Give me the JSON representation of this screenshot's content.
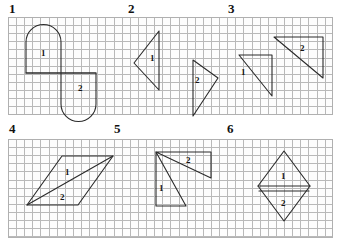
{
  "page": {
    "background_color": "#ffffff",
    "grid_color": "#b9b9b9",
    "ink_color": "#2a2a2a"
  },
  "rows": [
    {
      "band_name": "top-grid-band",
      "panels": [
        {
          "number": "1",
          "parts": [
            "1",
            "2"
          ]
        },
        {
          "number": "2",
          "parts": [
            "1",
            "2"
          ]
        },
        {
          "number": "3",
          "parts": [
            "1",
            "2"
          ]
        }
      ]
    },
    {
      "band_name": "bottom-grid-band",
      "panels": [
        {
          "number": "4",
          "parts": [
            "1",
            "2"
          ]
        },
        {
          "number": "5",
          "parts": [
            "1",
            "2"
          ]
        },
        {
          "number": "6",
          "parts": [
            "1",
            "2"
          ]
        }
      ]
    }
  ],
  "panel_labels": {
    "p1": "1",
    "p2": "2",
    "p3": "3",
    "p4": "4",
    "p5": "5",
    "p6": "6"
  },
  "part_labels": {
    "f1a": "1",
    "f1b": "2",
    "f2a": "1",
    "f2b": "2",
    "f3a": "1",
    "f3b": "2",
    "f4a": "1",
    "f4b": "2",
    "f5a": "1",
    "f5b": "2",
    "f6a": "1",
    "f6b": "2"
  },
  "figures": {
    "fig1": {
      "shape": "s-shape of two stadium halves",
      "parts": 2
    },
    "fig2": {
      "shape": "two mirrored triangles",
      "parts": 2
    },
    "fig3": {
      "shape": "two right triangles",
      "parts": 2
    },
    "fig4": {
      "shape": "parallelogram split by diagonal",
      "parts": 2
    },
    "fig5": {
      "shape": "two triangles sharing a vertex",
      "parts": 2
    },
    "fig6": {
      "shape": "rhombus split horizontally",
      "parts": 2
    }
  }
}
